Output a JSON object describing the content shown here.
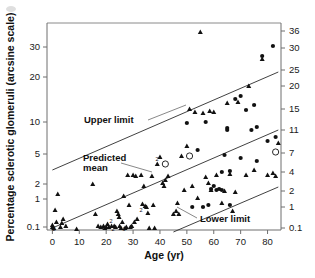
{
  "figure": {
    "background": "#ffffff",
    "ink_color": "#111111",
    "line_color": "#2b2b2b",
    "axis_color": "#6f6f6f"
  },
  "chart_data": {
    "type": "scatter",
    "title": "",
    "subtitle": "",
    "xlabel": "Age (yr)",
    "ylabel": "Percentage sclerotic glomeruli (arcsine scale)",
    "y2label": "",
    "grid": false,
    "legend_position": "none",
    "xlim": [
      -2,
      85
    ],
    "xticks": [
      0,
      10,
      20,
      30,
      40,
      50,
      60,
      70,
      80
    ],
    "xticklabels": [
      "0",
      "10",
      "20",
      "30",
      "40",
      "50",
      "60",
      "70",
      "80"
    ],
    "left_axis": {
      "scale": "arcsine",
      "ticks": [
        0.1,
        1,
        2,
        5,
        10,
        20,
        30
      ],
      "ticklabels": [
        "0.1",
        "1",
        "2",
        "5",
        "10",
        "20",
        "30"
      ],
      "tick_y_px": [
        227,
        199,
        184,
        154,
        122,
        77,
        47
      ]
    },
    "right_axis": {
      "scale": "arcsine",
      "ticks": [
        0.1,
        1,
        2,
        4,
        7,
        11,
        15,
        20,
        25,
        30,
        36
      ],
      "ticklabels": [
        "0.1",
        "1",
        "2",
        "4",
        "7",
        "11",
        "15",
        "20",
        "25",
        "30",
        "36"
      ],
      "tick_y_px": [
        228,
        207,
        191,
        172,
        153,
        130,
        109,
        86,
        70,
        48,
        31
      ]
    },
    "annotations": [
      {
        "id": "upper-limit",
        "text": "Upper limit"
      },
      {
        "id": "predicted-mean",
        "text": "Predicted\nmean",
        "line1": "Predicted",
        "line2": "mean"
      },
      {
        "id": "lower-limit",
        "text": "Lower limit"
      }
    ],
    "reference_lines": [
      {
        "name": "Upper limit",
        "x_from": 0,
        "x_to": 84,
        "y_from_px": 170,
        "y_to_px": 72
      },
      {
        "name": "Predicted mean",
        "x_from": 0,
        "x_to": 84,
        "y_from_px": 228,
        "y_to_px": 130
      },
      {
        "name": "Lower limit",
        "x_from": 45,
        "x_to": 84,
        "y_from_px": 232,
        "y_to_px": 187
      }
    ],
    "series": [
      {
        "name": "triangle markers",
        "marker": "triangle",
        "points": [
          [
            0,
            227
          ],
          [
            0,
            225
          ],
          [
            0.5,
            228
          ],
          [
            1,
            210
          ],
          [
            1.5,
            222
          ],
          [
            2,
            194
          ],
          [
            3,
            227
          ],
          [
            3.5,
            223
          ],
          [
            4,
            219
          ],
          [
            5,
            226
          ],
          [
            9,
            229
          ],
          [
            15,
            184
          ],
          [
            16,
            214
          ],
          [
            17,
            226
          ],
          [
            18,
            227
          ],
          [
            19,
            226
          ],
          [
            19.5,
            228
          ],
          [
            20,
            227
          ],
          [
            20.5,
            224
          ],
          [
            21,
            227
          ],
          [
            22,
            226
          ],
          [
            23,
            226
          ],
          [
            23.5,
            227
          ],
          [
            24,
            211
          ],
          [
            24.5,
            214
          ],
          [
            24.8,
            217
          ],
          [
            25,
            226
          ],
          [
            25.5,
            228
          ],
          [
            26,
            222
          ],
          [
            26.5,
            196
          ],
          [
            27,
            228
          ],
          [
            27.5,
            227
          ],
          [
            28,
            175
          ],
          [
            28.5,
            205
          ],
          [
            29,
            227
          ],
          [
            29.5,
            226
          ],
          [
            30,
            175
          ],
          [
            30.5,
            222
          ],
          [
            31,
            176
          ],
          [
            31.5,
            219
          ],
          [
            33,
            175
          ],
          [
            33.5,
            204
          ],
          [
            34,
            186
          ],
          [
            34.5,
            206
          ],
          [
            35,
            207
          ],
          [
            35.5,
            213
          ],
          [
            36,
            228
          ],
          [
            37,
            176
          ],
          [
            37.5,
            205
          ],
          [
            38,
            228
          ],
          [
            39,
            164
          ],
          [
            40,
            157
          ],
          [
            41,
            183
          ],
          [
            41.5,
            186
          ],
          [
            42,
            180
          ],
          [
            43,
            176
          ],
          [
            45,
            214
          ],
          [
            46,
            211
          ],
          [
            46.5,
            203
          ],
          [
            47,
            214
          ],
          [
            48,
            156
          ],
          [
            49,
            190
          ],
          [
            50,
            146
          ],
          [
            51,
            109
          ],
          [
            52,
            186
          ],
          [
            53,
            112
          ],
          [
            54,
            198
          ],
          [
            55,
            32
          ],
          [
            56,
            113
          ],
          [
            57,
            177
          ],
          [
            58,
            183
          ],
          [
            58.5,
            111
          ],
          [
            59,
            190
          ],
          [
            60,
            112
          ],
          [
            61,
            175
          ],
          [
            63,
            203
          ],
          [
            64,
            191
          ],
          [
            65,
            103
          ],
          [
            66,
            174
          ],
          [
            67,
            211
          ],
          [
            68,
            192
          ],
          [
            69,
            102
          ],
          [
            72,
            175
          ],
          [
            73,
            86
          ],
          [
            75,
            170
          ],
          [
            78,
            59
          ],
          [
            80,
            175
          ],
          [
            82,
            173
          ],
          [
            83,
            176
          ],
          [
            84,
            143
          ]
        ]
      },
      {
        "name": "circle markers",
        "marker": "circle",
        "points": [
          [
            50,
            123
          ],
          [
            54,
            150
          ],
          [
            57,
            122
          ],
          [
            59,
            189
          ],
          [
            60,
            186
          ],
          [
            61,
            190
          ],
          [
            62,
            189
          ],
          [
            63,
            190
          ],
          [
            64,
            155
          ],
          [
            65,
            128
          ],
          [
            65,
            130
          ],
          [
            66,
            205
          ],
          [
            68,
            99
          ],
          [
            70,
            96
          ],
          [
            72,
            110
          ],
          [
            74,
            130
          ],
          [
            75,
            105
          ],
          [
            76,
            127
          ],
          [
            78,
            56
          ],
          [
            80,
            141
          ],
          [
            82,
            46
          ],
          [
            83,
            137
          ],
          [
            58,
            205
          ],
          [
            56,
            207
          ],
          [
            52,
            207
          ],
          [
            63,
            172
          ],
          [
            66,
            171
          ],
          [
            70,
            158
          ],
          [
            76,
            161
          ]
        ]
      },
      {
        "name": "ringed markers",
        "marker": "ring",
        "points": [
          [
            42,
            164
          ],
          [
            51,
            156
          ],
          [
            83,
            152
          ]
        ]
      }
    ],
    "multiplicity_labels": [
      {
        "text": "2",
        "x_px": 54,
        "y_px": 231
      },
      {
        "text": "2",
        "x_px": 111,
        "y_px": 223
      },
      {
        "text": "2",
        "x_px": 113,
        "y_px": 231
      },
      {
        "text": "3",
        "x_px": 124,
        "y_px": 231
      },
      {
        "text": "2",
        "x_px": 141,
        "y_px": 212
      },
      {
        "text": "2",
        "x_px": 157,
        "y_px": 161
      }
    ]
  }
}
